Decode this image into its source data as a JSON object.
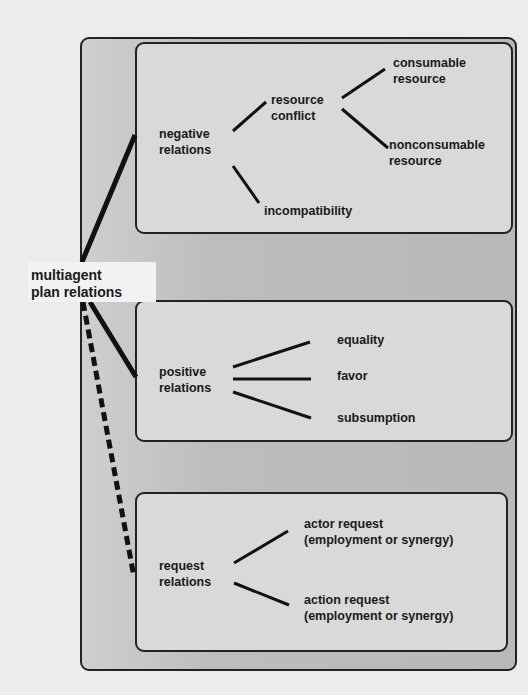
{
  "diagram": {
    "root": {
      "label": "multiagent\nplan relations"
    },
    "groups": [
      {
        "id": "negative",
        "label": "negative\nrelations",
        "connector": "solid",
        "children": [
          {
            "label": "resource\nconflict",
            "children": [
              {
                "label": "consumable\nresource"
              },
              {
                "label": "nonconsumable\nresource"
              }
            ]
          },
          {
            "label": "incompatibility"
          }
        ]
      },
      {
        "id": "positive",
        "label": "positive\nrelations",
        "connector": "solid",
        "children": [
          {
            "label": "equality"
          },
          {
            "label": "favor"
          },
          {
            "label": "subsumption"
          }
        ]
      },
      {
        "id": "request",
        "label": "request\nrelations",
        "connector": "dashed",
        "children": [
          {
            "label": "actor request\n(employment or synergy)"
          },
          {
            "label": "action request\n(employment or synergy)"
          }
        ]
      }
    ]
  }
}
